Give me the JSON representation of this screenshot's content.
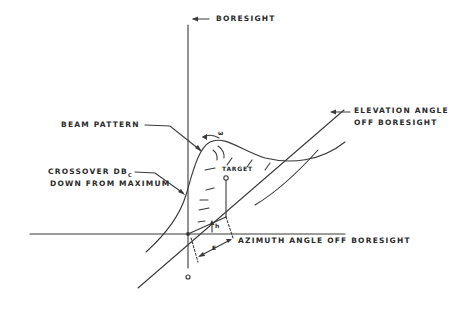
{
  "labels": {
    "boresight": "BORESIGHT",
    "elevation_line1": "ELEVATION ANGLE",
    "elevation_line2": "OFF BORESIGHT",
    "beam_pattern": "BEAM PATTERN",
    "crossover_line1": "CROSSOVER DB",
    "crossover_sub": "C",
    "crossover_line2": "DOWN FROM MAXIMUM",
    "target": "TARGET",
    "azimuth": "AZIMUTH ANGLE OFF BORESIGHT",
    "epsilon": "E",
    "eta": "h",
    "omega": "ω",
    "origin": "o"
  },
  "colors": {
    "stroke": "#3a3a3a",
    "background": "#ffffff"
  }
}
